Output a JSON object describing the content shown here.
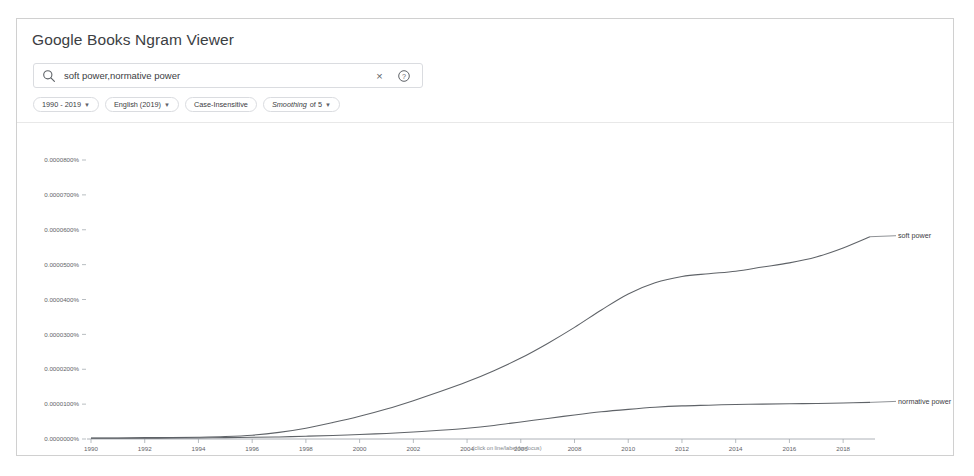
{
  "app": {
    "title": "Google Books Ngram Viewer"
  },
  "search": {
    "value": "soft power,normative power",
    "search_icon": "search-icon",
    "clear_icon": "close-icon",
    "clear_glyph": "×",
    "help_icon": "help-circle-icon"
  },
  "filters": [
    {
      "label": "1990 - 2019",
      "has_caret": true,
      "italic_lead": false
    },
    {
      "label": "English (2019)",
      "has_caret": true,
      "italic_lead": false
    },
    {
      "label": "Case-Insensitive",
      "has_caret": false,
      "italic_lead": false
    },
    {
      "label": "Smoothing of 5",
      "lead": "Smoothing",
      "rest": " of 5",
      "has_caret": true,
      "italic_lead": true
    }
  ],
  "chart_data": {
    "type": "line",
    "title": "",
    "xlabel": "",
    "ylabel": "",
    "footnote": "(click on line/label for focus)",
    "grid": false,
    "legend_position": "right-inline",
    "xlim": [
      1990,
      2019
    ],
    "ylim": [
      0,
      8e-05
    ],
    "xticks": [
      1990,
      1992,
      1994,
      1996,
      1998,
      2000,
      2002,
      2004,
      2006,
      2008,
      2010,
      2012,
      2014,
      2016,
      2018
    ],
    "yticks": [
      0,
      1e-05,
      2e-05,
      3e-05,
      4e-05,
      5e-05,
      6e-05,
      7e-05,
      8e-05
    ],
    "ytick_labels": [
      "0.0000000%",
      "0.0000100%",
      "0.0000200%",
      "0.0000300%",
      "0.0000400%",
      "0.0000500%",
      "0.0000600%",
      "0.0000700%",
      "0.0000800%"
    ],
    "x": [
      1990,
      1991,
      1992,
      1993,
      1994,
      1995,
      1996,
      1997,
      1998,
      1999,
      2000,
      2001,
      2002,
      2003,
      2004,
      2005,
      2006,
      2007,
      2008,
      2009,
      2010,
      2011,
      2012,
      2013,
      2014,
      2015,
      2016,
      2017,
      2018,
      2019
    ],
    "series": [
      {
        "name": "soft power",
        "color": "#5f6368",
        "values": [
          3e-07,
          3e-07,
          4e-07,
          4e-07,
          5e-07,
          7e-07,
          1.1e-06,
          1.9e-06,
          3.1e-06,
          4.7e-06,
          6.5e-06,
          8.6e-06,
          1.1e-05,
          1.36e-05,
          1.64e-05,
          1.96e-05,
          2.32e-05,
          2.74e-05,
          3.2e-05,
          3.7e-05,
          4.16e-05,
          4.48e-05,
          4.66e-05,
          4.74e-05,
          4.81e-05,
          4.93e-05,
          5.05e-05,
          5.22e-05,
          5.48e-05,
          5.8e-05
        ]
      },
      {
        "name": "normative power",
        "color": "#5f6368",
        "values": [
          2e-07,
          2e-07,
          2e-07,
          3e-07,
          3e-07,
          4e-07,
          5e-07,
          6e-07,
          8e-07,
          1e-06,
          1.3e-06,
          1.6e-06,
          2e-06,
          2.5e-06,
          3.1e-06,
          3.9e-06,
          4.9e-06,
          5.9e-06,
          6.9e-06,
          7.8e-06,
          8.5e-06,
          9.1e-06,
          9.5e-06,
          9.7e-06,
          9.9e-06,
          1e-05,
          1.01e-05,
          1.02e-05,
          1.03e-05,
          1.05e-05
        ]
      }
    ]
  }
}
